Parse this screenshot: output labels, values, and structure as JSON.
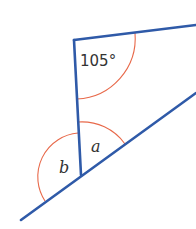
{
  "diagram": {
    "type": "geometry-angles",
    "colors": {
      "line": "#2f5aa8",
      "arc": "#e8694a",
      "text": "#333333",
      "background": "#ffffff"
    },
    "labels": {
      "angle_top": "105°",
      "angle_a": "a",
      "angle_b": "b"
    }
  }
}
